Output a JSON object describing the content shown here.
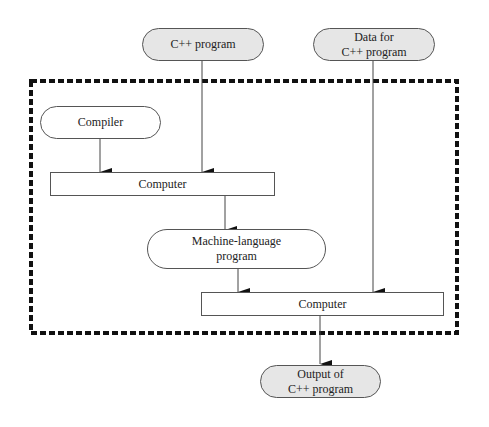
{
  "diagram": {
    "type": "flowchart",
    "nodes": {
      "cpp_program": {
        "label": "C++ program",
        "shape": "pill",
        "fill": "#e6e6e6"
      },
      "data_for_cpp": {
        "label": "Data for\nC++ program",
        "shape": "pill",
        "fill": "#e6e6e6"
      },
      "compiler": {
        "label": "Compiler",
        "shape": "pill",
        "fill": "#ffffff"
      },
      "computer_1": {
        "label": "Computer",
        "shape": "rectangle",
        "fill": "#ffffff"
      },
      "machine_language": {
        "label": "Machine-language\nprogram",
        "shape": "pill",
        "fill": "#ffffff"
      },
      "computer_2": {
        "label": "Computer",
        "shape": "rectangle",
        "fill": "#ffffff"
      },
      "output": {
        "label": "Output of\nC++ program",
        "shape": "pill",
        "fill": "#e6e6e6"
      }
    },
    "edges": [
      {
        "from": "cpp_program",
        "to": "computer_1"
      },
      {
        "from": "compiler",
        "to": "computer_1"
      },
      {
        "from": "computer_1",
        "to": "machine_language"
      },
      {
        "from": "machine_language",
        "to": "computer_2"
      },
      {
        "from": "data_for_cpp",
        "to": "computer_2"
      },
      {
        "from": "computer_2",
        "to": "output"
      }
    ],
    "boundary": {
      "style": "hatched-dashed",
      "color": "#111111"
    }
  }
}
